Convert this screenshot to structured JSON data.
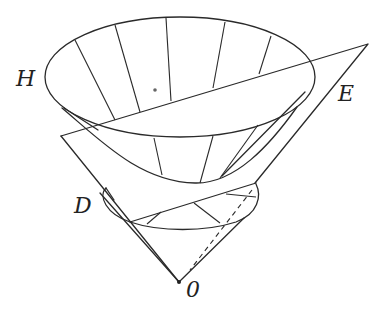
{
  "diagram": {
    "type": "geometric-figure",
    "labels": {
      "H": "H",
      "E": "E",
      "D": "D",
      "O": "0"
    },
    "colors": {
      "stroke": "#2a2a2a",
      "background": "#ffffff"
    }
  }
}
